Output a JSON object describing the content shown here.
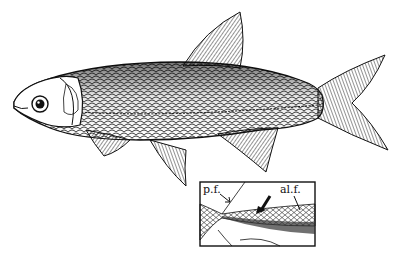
{
  "figure": {
    "inset": {
      "labels": {
        "pf": "p.f.",
        "alf": "al.f."
      }
    }
  },
  "colors": {
    "ink": "#111111",
    "paper": "#ffffff"
  }
}
